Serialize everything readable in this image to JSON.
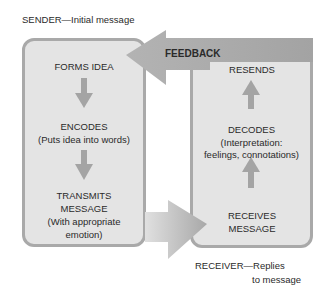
{
  "sender_caption": "SENDER—Initial message",
  "receiver_caption": [
    "RECEIVER—Replies",
    "to message"
  ],
  "feedback_label": "FEEDBACK",
  "sender_steps": [
    {
      "title": "FORMS IDEA"
    },
    {
      "title": "ENCODES",
      "detail": "(Puts idea into words)"
    },
    {
      "title": "TRANSMITS",
      "title2": "MESSAGE",
      "detail": "(With appropriate",
      "detail2": "emotion)"
    }
  ],
  "receiver_steps": [
    {
      "title": "RESENDS"
    },
    {
      "title": "DECODES",
      "detail": "(Interpretation:",
      "detail2": "feelings, connotations)"
    },
    {
      "title": "RECEIVES",
      "title2": "MESSAGE"
    }
  ],
  "colors": {
    "box_fill": "#e4e4e4",
    "box_border": "#a9a9a9",
    "arrow": "#a6a6a6",
    "text": "#2a2a2a"
  }
}
